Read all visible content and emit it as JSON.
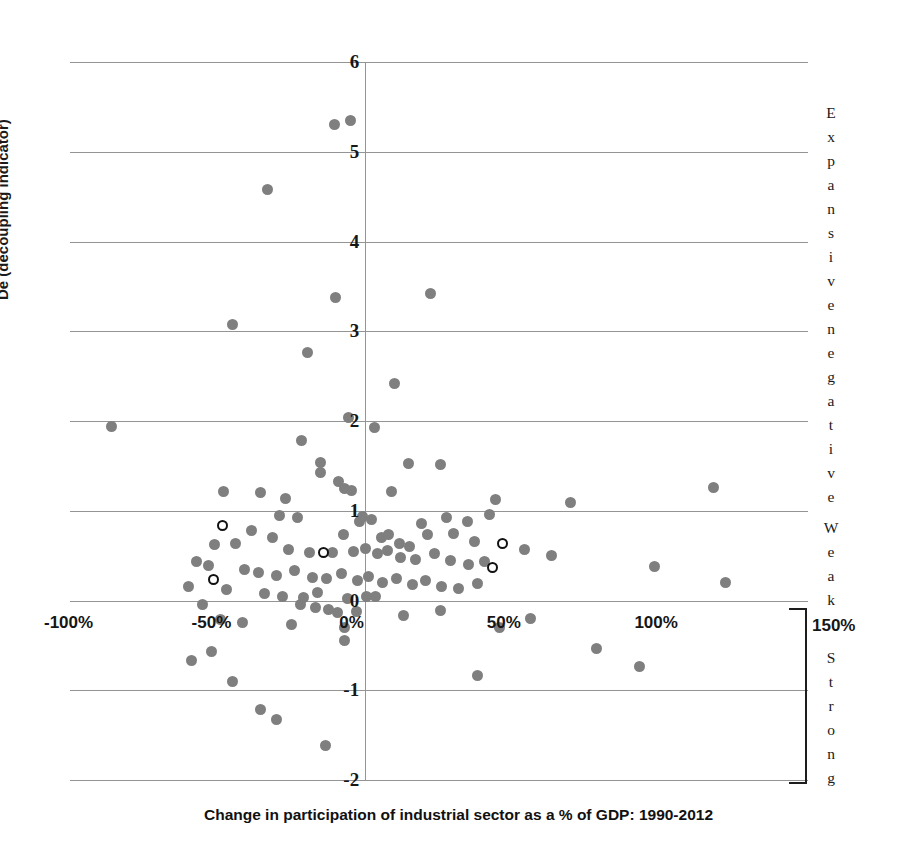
{
  "chart_data": {
    "type": "scatter",
    "title": "",
    "xlabel": "Change in participation of industrial sector as a % of GDP: 1990-2012",
    "ylabel": "De (decoupling indicator)",
    "xlim": [
      -100,
      150
    ],
    "ylim": [
      -2,
      6
    ],
    "grid": true,
    "legend_position": "none",
    "xticks": [
      "-100%",
      "-50%",
      "0%",
      "50%",
      "100%",
      "150%"
    ],
    "xtick_values": [
      -100,
      -50,
      0,
      50,
      100,
      150
    ],
    "yticks": [
      "-2",
      "-1",
      "0",
      "1",
      "2",
      "3",
      "4",
      "5",
      "6"
    ],
    "ytick_values": [
      -2,
      -1,
      0,
      1,
      2,
      3,
      4,
      5,
      6
    ],
    "annotations": [
      {
        "name": "expansive-negative",
        "text": "Expansive negative",
        "orientation": "vertical",
        "y_range": [
          2.0,
          6.0
        ]
      },
      {
        "name": "weak",
        "text": "Weak",
        "orientation": "vertical",
        "y_range": [
          0.0,
          1.0
        ]
      },
      {
        "name": "strong",
        "text": "Strong",
        "orientation": "vertical",
        "y_range": [
          -2.0,
          0.0
        ]
      },
      {
        "name": "x-axis-end-label",
        "text": "150%",
        "orientation": "horizontal"
      }
    ],
    "series": [
      {
        "name": "Countries (filled)",
        "marker": "filled-circle",
        "color": "#7f7f7f",
        "points": [
          [
            -10.5,
            5.3
          ],
          [
            -5.0,
            5.35
          ],
          [
            -33.0,
            4.58
          ],
          [
            -10.0,
            3.38
          ],
          [
            22.0,
            3.42
          ],
          [
            -45.0,
            3.07
          ],
          [
            -19.5,
            2.76
          ],
          [
            10.0,
            2.42
          ],
          [
            -5.5,
            2.04
          ],
          [
            3.0,
            1.93
          ],
          [
            -86.0,
            1.94
          ],
          [
            -21.5,
            1.78
          ],
          [
            -15.0,
            1.54
          ],
          [
            -15.0,
            1.43
          ],
          [
            -9.0,
            1.33
          ],
          [
            -7.0,
            1.25
          ],
          [
            14.5,
            1.53
          ],
          [
            25.5,
            1.52
          ],
          [
            -48.0,
            1.21
          ],
          [
            -35.5,
            1.2
          ],
          [
            -27.0,
            1.14
          ],
          [
            -4.5,
            1.23
          ],
          [
            9.0,
            1.22
          ],
          [
            44.0,
            1.13
          ],
          [
            42.0,
            0.96
          ],
          [
            69.5,
            1.09
          ],
          [
            118.0,
            1.26
          ],
          [
            -29.0,
            0.95
          ],
          [
            -23.0,
            0.93
          ],
          [
            -2.0,
            0.88
          ],
          [
            -1.0,
            0.94
          ],
          [
            2.0,
            0.9
          ],
          [
            19.0,
            0.86
          ],
          [
            27.5,
            0.92
          ],
          [
            34.5,
            0.88
          ],
          [
            -38.5,
            0.78
          ],
          [
            -31.5,
            0.7
          ],
          [
            -7.5,
            0.73
          ],
          [
            5.5,
            0.7
          ],
          [
            8.0,
            0.74
          ],
          [
            11.5,
            0.64
          ],
          [
            15.0,
            0.6
          ],
          [
            21.0,
            0.73
          ],
          [
            30.0,
            0.75
          ],
          [
            37.0,
            0.66
          ],
          [
            -51.0,
            0.62
          ],
          [
            -44.0,
            0.63
          ],
          [
            -26.0,
            0.57
          ],
          [
            -19.0,
            0.53
          ],
          [
            -11.0,
            0.54
          ],
          [
            -4.0,
            0.55
          ],
          [
            0.0,
            0.58
          ],
          [
            4.0,
            0.52
          ],
          [
            7.5,
            0.56
          ],
          [
            12.0,
            0.48
          ],
          [
            17.0,
            0.46
          ],
          [
            23.5,
            0.52
          ],
          [
            29.0,
            0.45
          ],
          [
            35.0,
            0.4
          ],
          [
            40.5,
            0.43
          ],
          [
            54.0,
            0.57
          ],
          [
            63.0,
            0.5
          ],
          [
            98.0,
            0.38
          ],
          [
            122.0,
            0.2
          ],
          [
            -57.0,
            0.43
          ],
          [
            -53.0,
            0.39
          ],
          [
            -41.0,
            0.34
          ],
          [
            -36.0,
            0.31
          ],
          [
            -30.0,
            0.28
          ],
          [
            -24.0,
            0.33
          ],
          [
            -18.0,
            0.26
          ],
          [
            -13.0,
            0.24
          ],
          [
            -8.0,
            0.3
          ],
          [
            -2.5,
            0.22
          ],
          [
            1.0,
            0.27
          ],
          [
            6.0,
            0.2
          ],
          [
            10.5,
            0.25
          ],
          [
            16.0,
            0.18
          ],
          [
            20.5,
            0.22
          ],
          [
            26.0,
            0.16
          ],
          [
            31.5,
            0.13
          ],
          [
            38.0,
            0.19
          ],
          [
            -60.0,
            0.16
          ],
          [
            -47.0,
            0.12
          ],
          [
            -34.0,
            0.08
          ],
          [
            -28.0,
            0.05
          ],
          [
            -21.0,
            0.03
          ],
          [
            -16.0,
            0.09
          ],
          [
            -6.0,
            0.02
          ],
          [
            0.5,
            0.05
          ],
          [
            3.5,
            0.04
          ],
          [
            -22.0,
            -0.05
          ],
          [
            -17.0,
            -0.08
          ],
          [
            -12.5,
            -0.1
          ],
          [
            -9.5,
            -0.13
          ],
          [
            -3.0,
            -0.12
          ],
          [
            -55.0,
            -0.05
          ],
          [
            -49.0,
            -0.21
          ],
          [
            -41.5,
            -0.24
          ],
          [
            -25.0,
            -0.27
          ],
          [
            -7.0,
            -0.3
          ],
          [
            -7.0,
            -0.45
          ],
          [
            13.0,
            -0.17
          ],
          [
            25.5,
            -0.11
          ],
          [
            45.5,
            -0.3
          ],
          [
            56.0,
            -0.2
          ],
          [
            -52.0,
            -0.57
          ],
          [
            -59.0,
            -0.67
          ],
          [
            -45.0,
            -0.9
          ],
          [
            78.5,
            -0.53
          ],
          [
            93.0,
            -0.73
          ],
          [
            -35.5,
            -1.22
          ],
          [
            -30.0,
            -1.33
          ],
          [
            38.0,
            -0.84
          ],
          [
            -13.5,
            -1.62
          ]
        ]
      },
      {
        "name": "Highlighted (hollow)",
        "marker": "open-circle",
        "color": "#111111",
        "points": [
          [
            -48.5,
            0.84
          ],
          [
            -51.5,
            0.23
          ],
          [
            -14.0,
            0.53
          ],
          [
            46.5,
            0.64
          ],
          [
            43.0,
            0.37
          ]
        ]
      }
    ]
  },
  "axes": {
    "y_title": "De (decoupling indicator)",
    "x_title": "Change in participation of industrial sector as a % of GDP: 1990-2012"
  },
  "side_labels": {
    "expansive_negative": "Expansive negative",
    "weak": "Weak",
    "strong": "Strong",
    "x_end": "150%"
  }
}
